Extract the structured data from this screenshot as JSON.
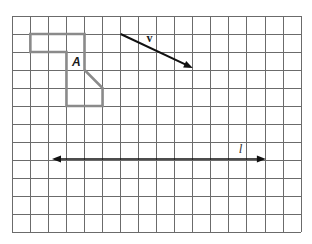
{
  "figure": {
    "grid": {
      "columns": 16,
      "rows": 12,
      "line_color": "#6b6b6b"
    },
    "shape_A": {
      "label": "A",
      "outline_color": "#8a8a8a",
      "vertices_grid": [
        [
          1,
          1
        ],
        [
          4,
          1
        ],
        [
          4,
          3
        ],
        [
          5,
          4
        ],
        [
          5,
          5
        ],
        [
          3,
          5
        ],
        [
          3,
          2
        ],
        [
          1,
          2
        ]
      ]
    },
    "vector_v": {
      "label": "v",
      "color": "#111111",
      "start_grid": [
        6,
        1
      ],
      "end_grid": [
        10,
        3
      ]
    },
    "line_l": {
      "label": "l",
      "color": "#111111",
      "row_grid": 8,
      "from_col_grid": 2.2,
      "to_col_grid": 14.05
    }
  }
}
